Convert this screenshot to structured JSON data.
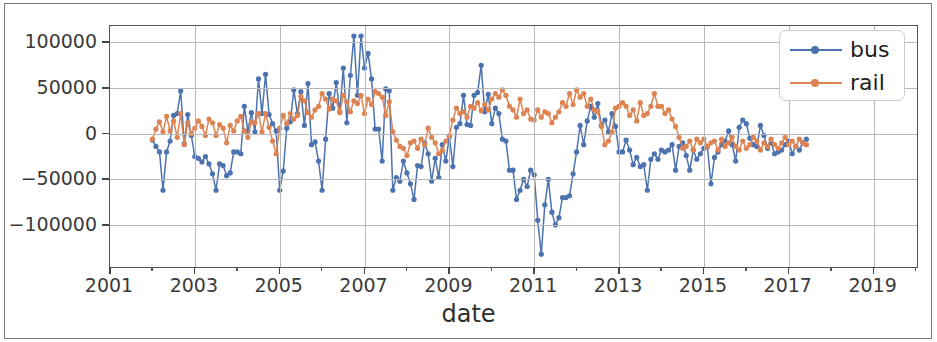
{
  "chart_data": {
    "type": "line",
    "title": "",
    "xlabel": "date",
    "ylabel": "",
    "grid": true,
    "legend_position": "upper right",
    "xlim": [
      2001.0,
      2020.0
    ],
    "ylim": [
      -145000,
      118000
    ],
    "x_tick_labels": [
      "2001",
      "2003",
      "2005",
      "2007",
      "2009",
      "2011",
      "2013",
      "2015",
      "2017",
      "2019"
    ],
    "x_tick_values": [
      2001,
      2003,
      2005,
      2007,
      2009,
      2011,
      2013,
      2015,
      2017,
      2019
    ],
    "x_minor_ticks": [
      2002,
      2004,
      2006,
      2008,
      2010,
      2012,
      2014,
      2016,
      2018,
      2020
    ],
    "y_tick_labels": [
      "100000",
      "50000",
      "0",
      "−50000",
      "−100000"
    ],
    "y_tick_values": [
      100000,
      50000,
      0,
      -50000,
      -100000
    ],
    "colors": {
      "bus": "#4C72B0",
      "rail": "#DD8452",
      "grid": "#b8b8b8",
      "axis": "#555555",
      "text": "#3a3a3a"
    },
    "x_start": 2002.0,
    "x_step": 0.08333,
    "series": [
      {
        "name": "bus",
        "color": "#4C72B0",
        "values": [
          -7000,
          -14000,
          -20000,
          -62000,
          -20000,
          -8000,
          20000,
          22000,
          47000,
          -11000,
          21000,
          -2000,
          -25000,
          -27000,
          -31000,
          -25000,
          -33000,
          -44000,
          -62000,
          -33000,
          -35000,
          -46000,
          -43000,
          -20000,
          -20000,
          -22000,
          30000,
          3000,
          23000,
          2000,
          60000,
          22000,
          65000,
          21000,
          11000,
          3000,
          -62000,
          -41000,
          6000,
          13000,
          48000,
          22000,
          46000,
          9000,
          55000,
          -12000,
          -9000,
          -30000,
          -62000,
          -6000,
          44000,
          28000,
          56000,
          24000,
          72000,
          12000,
          64000,
          107000,
          42000,
          107000,
          72000,
          88000,
          60000,
          5000,
          5000,
          -30000,
          49000,
          47000,
          -62000,
          -48000,
          -52000,
          -30000,
          -43000,
          -55000,
          -72000,
          -35000,
          -36000,
          -10000,
          -22000,
          -52000,
          -27000,
          -48000,
          -12000,
          -30000,
          -3000,
          -36000,
          7000,
          11000,
          42000,
          10000,
          9000,
          42000,
          45000,
          75000,
          24000,
          43000,
          11000,
          28000,
          22000,
          -6000,
          -8000,
          -40000,
          -40000,
          -72000,
          -62000,
          -50000,
          -58000,
          -40000,
          -45000,
          -95000,
          -132000,
          -78000,
          -50000,
          -86000,
          -100000,
          -92000,
          -70000,
          -70000,
          -68000,
          -44000,
          -20000,
          9000,
          -12000,
          14000,
          30000,
          18000,
          33000,
          9000,
          15000,
          2000,
          22000,
          8000,
          -20000,
          -20000,
          -7000,
          -18000,
          -34000,
          -26000,
          -36000,
          -34000,
          -62000,
          -28000,
          -22000,
          -28000,
          -18000,
          -20000,
          -18000,
          -12000,
          -40000,
          -14000,
          -10000,
          -24000,
          -40000,
          -18000,
          -28000,
          -22000,
          -16000,
          -14000,
          -55000,
          -26000,
          -20000,
          -12000,
          -8000,
          3000,
          -12000,
          -30000,
          7000,
          15000,
          11000,
          -5000,
          -12000,
          -14000,
          9000,
          -2000,
          -16000,
          -10000,
          -22000,
          -20000,
          -18000,
          -12000,
          -8000,
          -22000,
          -14000,
          -18000,
          -10000,
          -6000
        ]
      },
      {
        "name": "rail",
        "color": "#DD8452",
        "values": [
          -6000,
          5000,
          13000,
          2000,
          19000,
          3000,
          14000,
          -4000,
          22000,
          -12000,
          12000,
          0,
          6000,
          14000,
          8000,
          -2000,
          16000,
          12000,
          -2000,
          10000,
          6000,
          -10000,
          9000,
          3000,
          14000,
          19000,
          3000,
          -4000,
          13000,
          12000,
          22000,
          2000,
          22000,
          7000,
          -8000,
          -22000,
          6000,
          20000,
          11000,
          22000,
          16000,
          20000,
          41000,
          36000,
          23000,
          18000,
          26000,
          30000,
          44000,
          38000,
          27000,
          38000,
          36000,
          23000,
          42000,
          35000,
          24000,
          36000,
          33000,
          42000,
          22000,
          38000,
          32000,
          46000,
          44000,
          40000,
          20000,
          35000,
          2000,
          -7000,
          -14000,
          -16000,
          -24000,
          -10000,
          -8000,
          -16000,
          -6000,
          -12000,
          6000,
          -4000,
          -10000,
          -22000,
          -18000,
          -8000,
          -2000,
          15000,
          28000,
          22000,
          24000,
          18000,
          30000,
          28000,
          34000,
          25000,
          32000,
          26000,
          38000,
          44000,
          40000,
          48000,
          42000,
          30000,
          26000,
          18000,
          38000,
          22000,
          26000,
          16000,
          15000,
          26000,
          18000,
          24000,
          22000,
          12000,
          18000,
          24000,
          34000,
          30000,
          44000,
          32000,
          48000,
          40000,
          44000,
          30000,
          38000,
          26000,
          24000,
          8000,
          -12000,
          -8000,
          2000,
          28000,
          30000,
          34000,
          30000,
          20000,
          26000,
          14000,
          34000,
          20000,
          22000,
          30000,
          44000,
          30000,
          30000,
          22000,
          26000,
          16000,
          8000,
          -4000,
          -16000,
          -14000,
          -8000,
          -18000,
          -6000,
          -10000,
          -6000,
          -14000,
          -10000,
          -8000,
          -18000,
          -6000,
          -14000,
          -10000,
          -4000,
          -14000,
          -18000,
          -8000,
          -16000,
          -12000,
          -4000,
          -8000,
          -18000,
          -10000,
          -14000,
          -6000,
          -12000,
          -16000,
          -10000,
          -4000,
          -12000,
          -8000,
          -14000,
          -6000,
          -10000,
          -12000
        ]
      }
    ]
  },
  "legend": {
    "items": [
      {
        "label": "bus",
        "color": "#4C72B0"
      },
      {
        "label": "rail",
        "color": "#DD8452"
      }
    ]
  },
  "axis": {
    "xlabel": "date"
  }
}
